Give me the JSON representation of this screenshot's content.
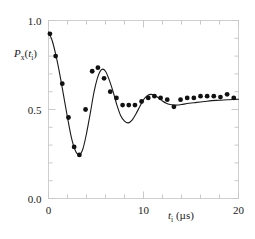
{
  "chart_data": {
    "type": "scatter",
    "title": "",
    "subtitle": "",
    "xlabel": "t_i (µs)",
    "xlabel_parts": {
      "symbol": "t",
      "symbol_sub": "i",
      "units": "(µs)"
    },
    "ylabel": "P_x(t_i)",
    "ylabel_parts": {
      "symbol": "P",
      "symbol_sub": "x",
      "arg": "t",
      "arg_sub": "i"
    },
    "xlim": [
      0,
      20
    ],
    "ylim": [
      0.0,
      1.0
    ],
    "xticks": [
      0,
      10,
      20
    ],
    "xtick_labels": [
      "0",
      "10",
      "20"
    ],
    "yticks": [
      0.0,
      0.5,
      1.0
    ],
    "ytick_labels": [
      "0.0",
      "0.5",
      "1.0"
    ],
    "x_minor_tick_step": 2,
    "y_minor_tick_step": 0.1,
    "grid": false,
    "frame": "box",
    "marker": "filled-circle",
    "marker_color": "#111111",
    "line_color": "#1a1a1a",
    "series": [
      {
        "name": "data",
        "type": "scatter",
        "x": [
          0.15,
          0.75,
          1.45,
          2.1,
          2.7,
          3.25,
          3.9,
          4.6,
          5.2,
          5.85,
          6.5,
          7.15,
          7.8,
          8.45,
          9.1,
          9.8,
          10.5,
          11.15,
          11.8,
          12.5,
          13.2,
          13.9,
          14.6,
          15.3,
          16.0,
          16.7,
          17.4,
          18.1,
          18.8,
          19.5
        ],
        "y": [
          0.925,
          0.8,
          0.645,
          0.455,
          0.29,
          0.245,
          0.5,
          0.715,
          0.735,
          0.675,
          0.6,
          0.565,
          0.525,
          0.525,
          0.525,
          0.545,
          0.565,
          0.575,
          0.565,
          0.555,
          0.515,
          0.555,
          0.565,
          0.565,
          0.575,
          0.575,
          0.575,
          0.57,
          0.585,
          0.565
        ]
      },
      {
        "name": "fit",
        "type": "line",
        "description": "damped oscillation fit",
        "x": [
          0.0,
          0.4,
          0.8,
          1.2,
          1.6,
          2.0,
          2.4,
          2.8,
          3.2,
          3.6,
          4.0,
          4.4,
          4.8,
          5.2,
          5.6,
          6.0,
          6.4,
          6.8,
          7.2,
          7.6,
          8.0,
          8.4,
          8.8,
          9.2,
          9.6,
          10.0,
          10.4,
          10.8,
          11.2,
          11.6,
          12.0,
          12.4,
          12.8,
          13.2,
          13.6,
          14.0,
          14.8,
          15.6,
          16.4,
          17.2,
          18.0,
          18.8,
          19.6,
          20.0
        ],
        "y": [
          0.935,
          0.885,
          0.8,
          0.695,
          0.575,
          0.455,
          0.345,
          0.272,
          0.245,
          0.275,
          0.365,
          0.48,
          0.6,
          0.685,
          0.725,
          0.715,
          0.665,
          0.6,
          0.525,
          0.465,
          0.435,
          0.425,
          0.44,
          0.475,
          0.515,
          0.555,
          0.578,
          0.585,
          0.578,
          0.565,
          0.548,
          0.535,
          0.528,
          0.525,
          0.525,
          0.528,
          0.535,
          0.54,
          0.545,
          0.55,
          0.552,
          0.555,
          0.557,
          0.558
        ]
      }
    ]
  },
  "colors": {
    "marker": "#111111",
    "line": "#1a1a1a",
    "axis": "#c9c9c9",
    "text": "#1a1a1a",
    "background": "#ffffff"
  }
}
